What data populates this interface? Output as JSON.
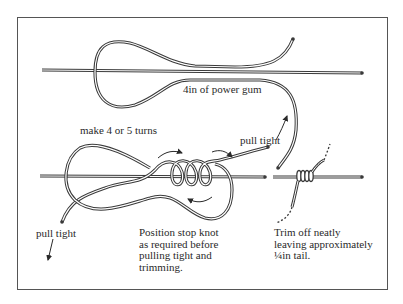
{
  "diagram": {
    "type": "knot-tying-illustration",
    "labels": {
      "length": "4in of power gum",
      "turns": "make 4 or 5 turns",
      "pull_tight_right": "pull tight",
      "pull_tight_left": "pull tight",
      "position": [
        "Position stop knot",
        "as required before",
        "pulling tight and",
        "trimming."
      ],
      "trim": [
        "Trim off neatly",
        "leaving approximately",
        "¼in tail."
      ]
    },
    "colors": {
      "line": "#3a3a3a",
      "frame": "#555555",
      "background": "#ffffff"
    },
    "steps": [
      {
        "name": "lay-loop",
        "description": "Loop of power gum laid along the line"
      },
      {
        "name": "wrap-turns",
        "description": "4 or 5 turns wrapped around the line"
      },
      {
        "name": "finished-knot",
        "description": "Knot pulled tight and trimmed"
      }
    ]
  }
}
